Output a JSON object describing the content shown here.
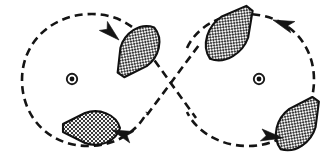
{
  "figure": {
    "canvas": {
      "width": 334,
      "height": 167
    },
    "colors": {
      "background": "#ffffff",
      "stroke": "#141414",
      "hull_outline": "#111111",
      "hull_fill_light": "#f2f2f2",
      "hatch": "#2b2b2b",
      "pivot": "#111111"
    },
    "line_style": {
      "name": "dashed",
      "dash_length": 8,
      "gap_length": 5,
      "stroke_width": 2.6
    }
  },
  "loops": [
    {
      "id": "left-loop",
      "label": "left-loop",
      "center": {
        "x": 74,
        "y": 79
      },
      "radius_x": 56,
      "radius_y": 62,
      "direction": "clockwise"
    },
    {
      "id": "right-loop",
      "label": "right-loop",
      "center": {
        "x": 259,
        "y": 79
      },
      "radius_x": 56,
      "radius_y": 62,
      "direction": "counter-clockwise"
    }
  ],
  "crossing_point": {
    "x": 167,
    "y": 84
  },
  "pivots": [
    {
      "id": "pivot-left",
      "label": "left-pivot-marker",
      "x": 72,
      "y": 79,
      "ring_radius": 5.2,
      "dot_radius": 2.4
    },
    {
      "id": "pivot-right",
      "label": "right-pivot-marker",
      "x": 259,
      "y": 79,
      "ring_radius": 5.2,
      "dot_radius": 2.4
    }
  ],
  "hulls": [
    {
      "id": "hull-upper-left",
      "label": "vessel-upper-left",
      "position": {
        "x": 137,
        "y": 52
      },
      "heading_degrees": 125,
      "quadrant": "upper-left-loop",
      "fill_pattern": "cross-hatch"
    },
    {
      "id": "hull-lower-left",
      "label": "vessel-lower-left",
      "position": {
        "x": 91,
        "y": 128
      },
      "heading_degrees": 180,
      "quadrant": "lower-left-loop",
      "fill_pattern": "cross-hatch"
    },
    {
      "id": "hull-upper-right",
      "label": "vessel-upper-right",
      "position": {
        "x": 231,
        "y": 32
      },
      "heading_degrees": 55,
      "quadrant": "upper-right-loop",
      "fill_pattern": "cross-hatch"
    },
    {
      "id": "hull-lower-right",
      "label": "vessel-lower-right",
      "position": {
        "x": 299,
        "y": 123
      },
      "heading_degrees": 55,
      "quadrant": "lower-right-loop",
      "fill_pattern": "cross-hatch"
    }
  ],
  "arrows": [
    {
      "id": "arrow-upper-left",
      "label": "direction-arrow-upper-left",
      "tip": {
        "x": 119,
        "y": 40
      },
      "heading_degrees": 138,
      "points": "down-right"
    },
    {
      "id": "arrow-lower-left",
      "label": "direction-arrow-lower-left",
      "tip": {
        "x": 112,
        "y": 130
      },
      "heading_degrees": 200,
      "points": "down-left"
    },
    {
      "id": "arrow-upper-right",
      "label": "direction-arrow-upper-right",
      "tip": {
        "x": 273,
        "y": 20
      },
      "heading_degrees": 292,
      "points": "up-left"
    },
    {
      "id": "arrow-lower-right",
      "label": "direction-arrow-lower-right",
      "tip": {
        "x": 283,
        "y": 138
      },
      "heading_degrees": 10,
      "points": "right"
    }
  ]
}
